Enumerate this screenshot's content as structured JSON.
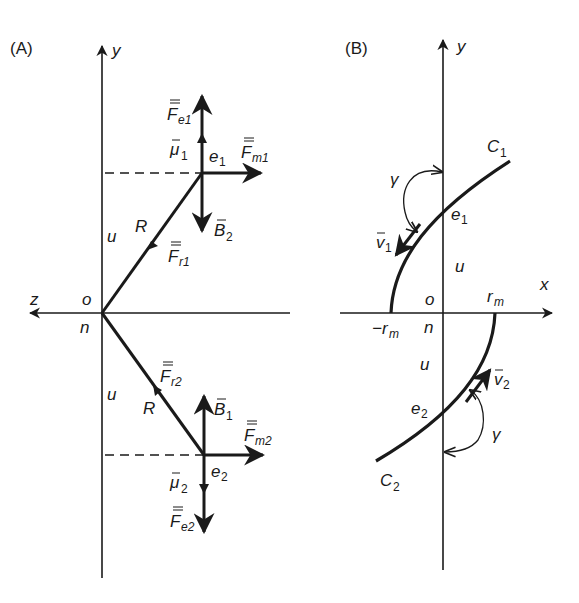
{
  "figure": {
    "panel_a": {
      "label": "(A)",
      "axes": {
        "y_label": "y",
        "z_label": "z",
        "origin_top": "o",
        "origin_bottom": "n"
      },
      "distance_labels": {
        "upper_u": "u",
        "lower_u": "u",
        "upper_R": "R",
        "lower_R": "R"
      },
      "particle_1": {
        "name": "e",
        "sub": "1",
        "vectors": [
          {
            "symbol": "F",
            "sub": "e1",
            "bar": "double",
            "direction": "up"
          },
          {
            "symbol": "μ",
            "sub": "1",
            "bar": "single",
            "direction": "up"
          },
          {
            "symbol": "F",
            "sub": "m1",
            "bar": "double",
            "direction": "right"
          },
          {
            "symbol": "B",
            "sub": "2",
            "bar": "single",
            "direction": "down"
          },
          {
            "symbol": "F",
            "sub": "r1",
            "bar": "double",
            "direction": "toward origin"
          }
        ]
      },
      "particle_2": {
        "name": "e",
        "sub": "2",
        "vectors": [
          {
            "symbol": "F",
            "sub": "e2",
            "bar": "double",
            "direction": "down"
          },
          {
            "symbol": "μ",
            "sub": "2",
            "bar": "single",
            "direction": "down"
          },
          {
            "symbol": "F",
            "sub": "m2",
            "bar": "double",
            "direction": "right"
          },
          {
            "symbol": "B",
            "sub": "1",
            "bar": "single",
            "direction": "up"
          },
          {
            "symbol": "F",
            "sub": "r2",
            "bar": "double",
            "direction": "toward e1 / away from origin"
          }
        ]
      }
    },
    "panel_b": {
      "label": "(B)",
      "axes": {
        "y_label": "y",
        "x_label": "x",
        "origin_top": "o",
        "origin_bottom": "n"
      },
      "ticks": {
        "pos": "r",
        "pos_sub": "m",
        "neg": "−r",
        "neg_sub": "m"
      },
      "distance_labels": {
        "upper_u": "u",
        "lower_u": "u"
      },
      "curves": [
        {
          "name": "C",
          "sub": "1"
        },
        {
          "name": "C",
          "sub": "2"
        }
      ],
      "particles": [
        {
          "name": "e",
          "sub": "1",
          "velocity": "v",
          "velocity_sub": "1",
          "angle": "γ"
        },
        {
          "name": "e",
          "sub": "2",
          "velocity": "v",
          "velocity_sub": "2",
          "angle": "γ"
        }
      ]
    },
    "colors": {
      "ink": "#1a1a1a",
      "background": "#ffffff"
    }
  }
}
